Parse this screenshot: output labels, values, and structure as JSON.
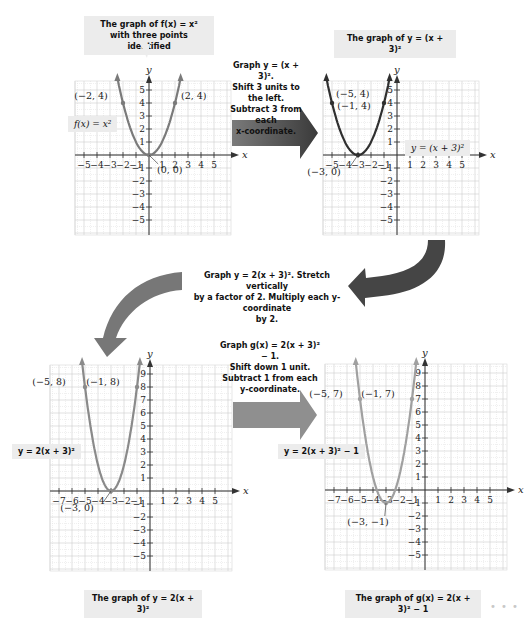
{
  "graph1": {
    "caption_line1": "The graph of f(x) = x²",
    "caption_line2": "with three points identified",
    "equation_label": "f(x) = x²",
    "points": [
      {
        "x": -2,
        "y": 4,
        "label": "(−2, 4)"
      },
      {
        "x": 0,
        "y": 0,
        "label": "(0, 0)"
      },
      {
        "x": 2,
        "y": 4,
        "label": "(2, 4)"
      }
    ],
    "x_ticks": [
      "−5",
      "−4",
      "−3",
      "−2",
      "−1",
      "1",
      "2",
      "3",
      "4",
      "5"
    ],
    "y_ticks": [
      "5",
      "4",
      "3",
      "2",
      "1",
      "−1",
      "−2",
      "−3",
      "−4",
      "−5"
    ],
    "curve_color": "#7a7a7a"
  },
  "step1": {
    "line1": "Graph y = (x + 3)².",
    "line2": "Shift 3 units to the left.",
    "line3": "Subtract 3 from each",
    "line4": "x-coordinate."
  },
  "graph2": {
    "caption": "The graph of y = (x + 3)²",
    "equation_label": "y = (x + 3)²",
    "points": [
      {
        "x": -5,
        "y": 4,
        "label": "(−5, 4)"
      },
      {
        "x": -3,
        "y": 0,
        "label": "(−3, 0)"
      },
      {
        "x": -1,
        "y": 4,
        "label": "(−1, 4)"
      }
    ],
    "x_ticks": [
      "−5",
      "−4",
      "−3",
      "−2",
      "−1",
      "1",
      "2",
      "3",
      "4",
      "5"
    ],
    "y_ticks": [
      "5",
      "4",
      "3",
      "2",
      "1",
      "−1",
      "−2",
      "−3",
      "−4",
      "−5"
    ],
    "curve_color": "#2f2f2f"
  },
  "step2": {
    "line1": "Graph y = 2(x + 3)². Stretch vertically",
    "line2": "by a factor of 2. Multiply each y-coordinate",
    "line3": "by 2."
  },
  "graph3": {
    "caption": "The graph of y = 2(x + 3)²",
    "equation_label": "y = 2(x + 3)²",
    "points": [
      {
        "x": -5,
        "y": 8,
        "label": "(−5, 8)"
      },
      {
        "x": -3,
        "y": 0,
        "label": "(−3, 0)"
      },
      {
        "x": -1,
        "y": 8,
        "label": "(−1, 8)"
      }
    ],
    "x_ticks": [
      "−7",
      "−6",
      "−5",
      "−4",
      "−3",
      "−2",
      "−1",
      "1",
      "2",
      "3",
      "4",
      "5"
    ],
    "y_ticks": [
      "9",
      "8",
      "7",
      "6",
      "5",
      "4",
      "3",
      "2",
      "1",
      "−1",
      "−2",
      "−3",
      "−4",
      "−5"
    ],
    "curve_color": "#8a8a8a"
  },
  "step3": {
    "line1": "Graph g(x) = 2(x + 3)² − 1.",
    "line2": "Shift down 1 unit.",
    "line3": "Subtract 1 from each",
    "line4": "y-coordinate."
  },
  "graph4": {
    "caption": "The graph of g(x) = 2(x + 3)² − 1",
    "equation_label": "y = 2(x + 3)² − 1",
    "points": [
      {
        "x": -5,
        "y": 7,
        "label": "(−5, 7)"
      },
      {
        "x": -3,
        "y": -1,
        "label": "(−3, −1)"
      },
      {
        "x": -1,
        "y": 7,
        "label": "(−1, 7)"
      }
    ],
    "x_ticks": [
      "−7",
      "−6",
      "−5",
      "−4",
      "−3",
      "−2",
      "−1",
      "1",
      "2",
      "3",
      "4",
      "5"
    ],
    "y_ticks": [
      "9",
      "8",
      "7",
      "6",
      "5",
      "4",
      "3",
      "2",
      "1",
      "−1",
      "−2",
      "−3",
      "−4",
      "−5"
    ],
    "curve_color": "#a0a0a0"
  },
  "axis_labels": {
    "x": "x",
    "y": "y"
  },
  "arrow_colors": {
    "step1": "#555555",
    "step2": "#444444",
    "step3_curve": "#777777",
    "step3": "#8c8c8c"
  },
  "footer_dots": "• • •"
}
